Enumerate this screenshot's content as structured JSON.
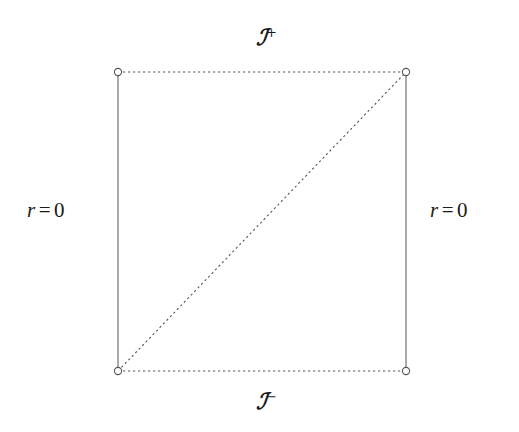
{
  "figure": {
    "type": "penrose-diagram",
    "background_color": "#ffffff",
    "line_color": "#555555",
    "text_color": "#1a1a1a",
    "width": 519,
    "height": 432
  },
  "labels": {
    "scri_plus": {
      "symbol": "ℐ",
      "superscript": "+",
      "position": "top-center"
    },
    "scri_minus": {
      "symbol": "ℐ",
      "superscript": "−",
      "position": "bottom-center"
    },
    "r_left": {
      "var": "r",
      "op": "=",
      "value": "0",
      "position": "left"
    },
    "r_right": {
      "var": "r",
      "op": "=",
      "value": "0",
      "position": "right"
    }
  },
  "geometry": {
    "box": {
      "left": 118,
      "right": 406,
      "top": 72,
      "bottom": 371
    },
    "edges": [
      {
        "name": "top-edge",
        "style": "dotted",
        "from": [
          118,
          72
        ],
        "to": [
          406,
          72
        ]
      },
      {
        "name": "bottom-edge",
        "style": "dotted",
        "from": [
          118,
          371
        ],
        "to": [
          406,
          371
        ]
      },
      {
        "name": "left-edge",
        "style": "solid",
        "from": [
          118,
          72
        ],
        "to": [
          118,
          371
        ]
      },
      {
        "name": "right-edge",
        "style": "solid",
        "from": [
          406,
          72
        ],
        "to": [
          406,
          371
        ]
      },
      {
        "name": "diagonal",
        "style": "dotted",
        "from": [
          118,
          371
        ],
        "to": [
          406,
          72
        ]
      }
    ],
    "vertices": [
      {
        "name": "top-left-vertex",
        "cx": 118,
        "cy": 72,
        "r": 3.6
      },
      {
        "name": "top-right-vertex",
        "cx": 406,
        "cy": 72,
        "r": 3.6
      },
      {
        "name": "bottom-left-vertex",
        "cx": 118,
        "cy": 371,
        "r": 3.6
      },
      {
        "name": "bottom-right-vertex",
        "cx": 406,
        "cy": 371,
        "r": 3.6
      }
    ]
  }
}
